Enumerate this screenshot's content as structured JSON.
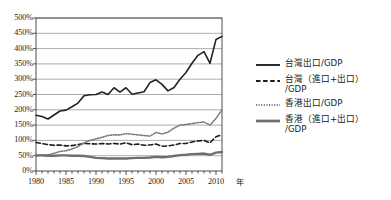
{
  "chart_data": {
    "type": "line",
    "title": "",
    "xlabel": "年",
    "ylabel": "",
    "xlim": [
      1980,
      2011
    ],
    "ylim": [
      0,
      500
    ],
    "grid": true,
    "legend_position": "right",
    "y_unit": "%",
    "y_ticks": [
      0,
      50,
      100,
      150,
      200,
      250,
      300,
      350,
      400,
      450,
      500
    ],
    "y_tick_labels": [
      "0%",
      "50%",
      "100%",
      "150%",
      "200%",
      "250%",
      "300%",
      "350%",
      "400%",
      "450%",
      "500%"
    ],
    "x_ticks": [
      1980,
      1985,
      1990,
      1995,
      2000,
      2005,
      2010
    ],
    "x_tick_labels": [
      "1980",
      "1985",
      "1990",
      "1995",
      "2000",
      "2005",
      "2010"
    ],
    "x_minor_tick_interval": 1,
    "x": [
      1980,
      1981,
      1982,
      1983,
      1984,
      1985,
      1986,
      1987,
      1988,
      1989,
      1990,
      1991,
      1992,
      1993,
      1994,
      1995,
      1996,
      1997,
      1998,
      1999,
      2000,
      2001,
      2002,
      2003,
      2004,
      2005,
      2006,
      2007,
      2008,
      2009,
      2010,
      2011
    ],
    "series": [
      {
        "name": "台灣出口/GDP",
        "style": "solid",
        "color": "#222222",
        "width": 1.6,
        "values": [
          182,
          178,
          170,
          183,
          196,
          199,
          210,
          222,
          246,
          249,
          250,
          258,
          250,
          272,
          258,
          272,
          251,
          255,
          259,
          289,
          298,
          283,
          262,
          273,
          300,
          322,
          352,
          378,
          390,
          352,
          430,
          440
        ]
      },
      {
        "name": "台灣（進口+出口）/GDP",
        "style": "dashed",
        "color": "#1c1c1c",
        "width": 1.6,
        "values": [
          93,
          90,
          86,
          84,
          85,
          82,
          83,
          86,
          90,
          89,
          88,
          90,
          88,
          90,
          88,
          92,
          86,
          88,
          84,
          85,
          88,
          81,
          82,
          85,
          90,
          90,
          95,
          98,
          100,
          92,
          112,
          118
        ]
      },
      {
        "name": "香港出口/GDP",
        "style": "dotted",
        "color": "#7a7a7a",
        "width": 1.6,
        "values": [
          50,
          52,
          52,
          58,
          64,
          66,
          72,
          80,
          92,
          100,
          105,
          110,
          116,
          118,
          118,
          122,
          120,
          118,
          116,
          114,
          126,
          121,
          127,
          140,
          150,
          152,
          155,
          158,
          160,
          150,
          172,
          200
        ]
      },
      {
        "name": "香港（進口+出口）/GDP",
        "style": "solid",
        "color": "#6e6e6e",
        "width": 2.4,
        "values": [
          51,
          51,
          50,
          50,
          51,
          51,
          50,
          50,
          49,
          46,
          43,
          42,
          41,
          41,
          41,
          41,
          42,
          43,
          43,
          44,
          46,
          45,
          46,
          49,
          52,
          53,
          55,
          56,
          57,
          53,
          60,
          62
        ]
      }
    ]
  },
  "legend": {
    "entries": [
      {
        "label": "台灣出口/GDP",
        "label2": "",
        "key": "solid-dark"
      },
      {
        "label": "台灣（進口+出口）",
        "label2": "/GDP",
        "key": "dashed-dark"
      },
      {
        "label": "香港出口/GDP",
        "label2": "",
        "key": "dotted-gray"
      },
      {
        "label": "香港（進口+出口）",
        "label2": "/GDP",
        "key": "solid-gray"
      }
    ]
  },
  "colors": {
    "plot_border": "#3a3a3a",
    "gridline": "#8a8a8a",
    "background": "#ffffff",
    "taiwan_export": "#222222",
    "taiwan_total": "#1c1c1c",
    "hk_export": "#7a7a7a",
    "hk_total": "#6e6e6e"
  }
}
